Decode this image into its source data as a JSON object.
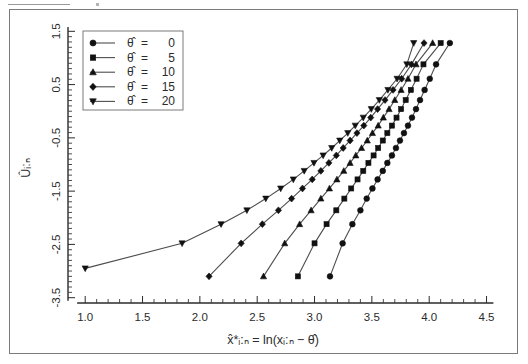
{
  "figure": {
    "kind": "probability-plot",
    "background": "#ffffff",
    "frame_color": "#7b7b7b"
  },
  "chart_data": {
    "type": "line",
    "title": "",
    "subtitle": "",
    "xlabel": "x̂*ᵢ:ₙ  =  ln(xᵢ:ₙ − θ̂)",
    "ylabel": "Ûᵢ:ₙ",
    "xlim": [
      0.85,
      4.6
    ],
    "ylim": [
      -3.6,
      1.6
    ],
    "xticks": [
      1.0,
      1.5,
      2.0,
      2.5,
      3.0,
      3.5,
      4.0,
      4.5
    ],
    "xtick_labels": [
      "1.0",
      "1.5",
      "2.0",
      "2.5",
      "3.0",
      "3.5",
      "4.0",
      "4.5"
    ],
    "yticks": [
      1.5,
      0.5,
      -0.5,
      -1.5,
      -2.5,
      -3.5
    ],
    "ytick_labels": [
      "1.5",
      "0.5",
      "-0.5",
      "-1.5",
      "-2.5",
      "-3.5"
    ],
    "grid": false,
    "minor_ticks": true,
    "legend_position": "upper-left",
    "legend_title": "",
    "marker_color": "#111111",
    "line_color": "#4d4d4d",
    "series": [
      {
        "name": "θ̂ =   0",
        "theta_hat": 0,
        "marker": "circle",
        "x": [
          3.135,
          3.245,
          3.33,
          3.4,
          3.455,
          3.505,
          3.55,
          3.595,
          3.635,
          3.675,
          3.71,
          3.745,
          3.78,
          3.815,
          3.85,
          3.885,
          3.92,
          3.96,
          4.005,
          4.06,
          4.18
        ],
        "y": [
          -3.1,
          -2.48,
          -2.12,
          -1.86,
          -1.64,
          -1.45,
          -1.28,
          -1.12,
          -0.97,
          -0.83,
          -0.69,
          -0.55,
          -0.41,
          -0.27,
          -0.12,
          0.04,
          0.21,
          0.4,
          0.61,
          0.88,
          1.28
        ]
      },
      {
        "name": "θ̂ =   5",
        "theta_hat": 5,
        "marker": "square",
        "x": [
          2.855,
          3.0,
          3.105,
          3.19,
          3.26,
          3.32,
          3.375,
          3.425,
          3.47,
          3.515,
          3.555,
          3.595,
          3.635,
          3.675,
          3.715,
          3.755,
          3.795,
          3.84,
          3.89,
          3.95,
          4.1
        ],
        "y": [
          -3.1,
          -2.48,
          -2.12,
          -1.86,
          -1.64,
          -1.45,
          -1.28,
          -1.12,
          -0.97,
          -0.83,
          -0.69,
          -0.55,
          -0.41,
          -0.27,
          -0.12,
          0.04,
          0.21,
          0.4,
          0.61,
          0.88,
          1.28
        ]
      },
      {
        "name": "θ̂ =  10",
        "theta_hat": 10,
        "marker": "triangle-up",
        "x": [
          2.555,
          2.74,
          2.87,
          2.97,
          3.055,
          3.13,
          3.195,
          3.255,
          3.31,
          3.36,
          3.41,
          3.46,
          3.505,
          3.555,
          3.6,
          3.65,
          3.7,
          3.755,
          3.815,
          3.885,
          4.03
        ],
        "y": [
          -3.1,
          -2.48,
          -2.12,
          -1.86,
          -1.64,
          -1.45,
          -1.28,
          -1.12,
          -0.97,
          -0.83,
          -0.69,
          -0.55,
          -0.41,
          -0.27,
          -0.12,
          0.04,
          0.21,
          0.4,
          0.61,
          0.88,
          1.28
        ]
      },
      {
        "name": "θ̂ =  15",
        "theta_hat": 15,
        "marker": "diamond",
        "x": [
          2.08,
          2.36,
          2.545,
          2.685,
          2.8,
          2.895,
          2.98,
          3.055,
          3.125,
          3.19,
          3.25,
          3.31,
          3.37,
          3.43,
          3.49,
          3.55,
          3.615,
          3.685,
          3.76,
          3.845,
          3.955
        ],
        "y": [
          -3.1,
          -2.48,
          -2.12,
          -1.86,
          -1.64,
          -1.45,
          -1.28,
          -1.12,
          -0.97,
          -0.83,
          -0.69,
          -0.55,
          -0.41,
          -0.27,
          -0.12,
          0.04,
          0.21,
          0.4,
          0.61,
          0.88,
          1.28
        ]
      },
      {
        "name": "θ̂ =  20",
        "theta_hat": 20,
        "marker": "triangle-down",
        "x": [
          1.0,
          1.845,
          2.185,
          2.41,
          2.575,
          2.705,
          2.815,
          2.91,
          2.995,
          3.075,
          3.15,
          3.22,
          3.29,
          3.355,
          3.425,
          3.495,
          3.565,
          3.64,
          3.72,
          3.805,
          3.865
        ],
        "y": [
          -2.95,
          -2.48,
          -2.12,
          -1.86,
          -1.64,
          -1.45,
          -1.28,
          -1.12,
          -0.97,
          -0.83,
          -0.69,
          -0.55,
          -0.41,
          -0.27,
          -0.12,
          0.04,
          0.21,
          0.4,
          0.61,
          0.88,
          1.28
        ]
      }
    ]
  },
  "legend": {
    "entries": [
      {
        "symbol": "θ̂",
        "equals": "=",
        "value": "0",
        "marker": "circle"
      },
      {
        "symbol": "θ̂",
        "equals": "=",
        "value": "5",
        "marker": "square"
      },
      {
        "symbol": "θ̂",
        "equals": "=",
        "value": "10",
        "marker": "triangle-up"
      },
      {
        "symbol": "θ̂",
        "equals": "=",
        "value": "15",
        "marker": "diamond"
      },
      {
        "symbol": "θ̂",
        "equals": "=",
        "value": "20",
        "marker": "triangle-down"
      }
    ]
  }
}
